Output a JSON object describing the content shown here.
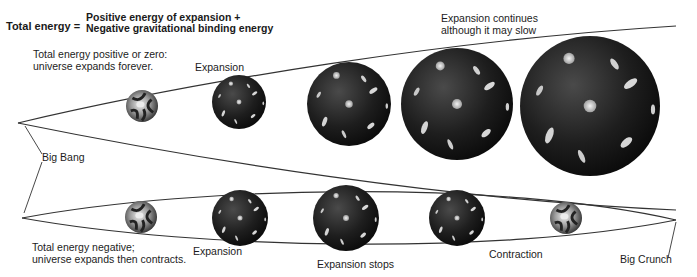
{
  "equation": {
    "left": "Total energy =",
    "right_line1": "Positive energy of expansion +",
    "right_line2": "Negative gravitational binding energy"
  },
  "top_scenario": {
    "caption_line1": "Total energy positive or zero:",
    "caption_line2": "universe expands forever.",
    "stage_label": "Expansion",
    "end_label_line1": "Expansion continues",
    "end_label_line2": "although it may slow"
  },
  "bottom_scenario": {
    "caption_line1": "Total energy negative;",
    "caption_line2": "universe expands then contracts.",
    "stage_labels": [
      "Expansion",
      "Expansion stops",
      "Contraction"
    ],
    "end_label": "Big Crunch"
  },
  "origin_label": "Big Bang",
  "colors": {
    "line": "#333333",
    "sphere_dark": "#111111",
    "sphere_mid": "#3a3a3a",
    "galaxy": "#d8d8d8"
  }
}
